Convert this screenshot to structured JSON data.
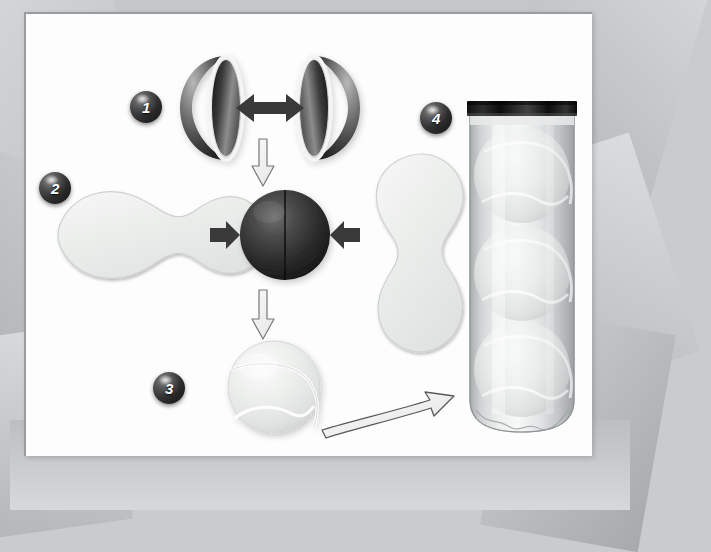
{
  "diagram": {
    "style": "grayscale technical illustration",
    "panel": {
      "background_color": "#fdfdfd",
      "frame_color": "#9a9da0"
    },
    "background": {
      "texture": "angular gray facets",
      "color": "#c4c6c8"
    },
    "steps": [
      {
        "number": "1",
        "badge_name": "step-1-badge",
        "caption": "Two rubber hemispheres are pressed together",
        "elements": [
          "rubber-hemisphere-left",
          "rubber-hemisphere-right",
          "double-arrow-horizontal"
        ]
      },
      {
        "number": "2",
        "badge_name": "step-2-badge",
        "caption": "Felt dog-bone panels are applied to the rubber core",
        "elements": [
          "felt-panel-left",
          "rubber-core-sphere",
          "felt-panel-right",
          "arrow-right",
          "arrow-left"
        ]
      },
      {
        "number": "3",
        "badge_name": "step-3-badge",
        "caption": "The finished tennis ball",
        "elements": [
          "finished-tennis-ball"
        ]
      },
      {
        "number": "4",
        "badge_name": "step-4-badge",
        "caption": "Three balls sealed inside a pressurised canister",
        "elements": [
          "ball-canister",
          "canister-cap",
          "canister-ball-1",
          "canister-ball-2",
          "canister-ball-3"
        ]
      }
    ],
    "connectors": [
      {
        "name": "double-arrow-horizontal",
        "type": "double-headed-arrow",
        "direction": "horizontal",
        "fill": "#3a3a3a"
      },
      {
        "name": "flow-arrow-1-to-2",
        "type": "outlined-arrow",
        "direction": "down",
        "fill": "#f2f2f2",
        "stroke": "#6b6b6b"
      },
      {
        "name": "arrow-felt-left",
        "type": "solid-arrow",
        "direction": "right",
        "fill": "#3a3a3a"
      },
      {
        "name": "arrow-felt-right",
        "type": "solid-arrow",
        "direction": "left",
        "fill": "#3a3a3a"
      },
      {
        "name": "flow-arrow-2-to-3",
        "type": "outlined-arrow",
        "direction": "down",
        "fill": "#f2f2f2",
        "stroke": "#6b6b6b"
      },
      {
        "name": "flow-arrow-3-to-4",
        "type": "outlined-curved-arrow",
        "direction": "right",
        "fill": "#f2f2f2",
        "stroke": "#555555"
      }
    ],
    "colors": {
      "rubber_dark": "#242424",
      "felt_light": "#eef0ef",
      "seam_line": "#ffffff",
      "badge_dark": "#1a1a1a",
      "outline_gray": "#6b6b6b",
      "canister_plastic": "#d3d6d6",
      "canister_cap": "#171717"
    },
    "counts": {
      "hemispheres": 2,
      "felt_panels": 2,
      "balls_in_canister": 3,
      "total_steps": 4
    }
  }
}
